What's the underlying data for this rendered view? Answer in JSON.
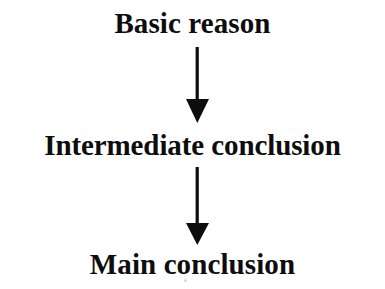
{
  "diagram": {
    "type": "flowchart",
    "orientation": "vertical-top-down",
    "background_color": "#ffffff",
    "ink_color": "#0d0d0d",
    "title": "",
    "nodes": [
      {
        "id": "basic-reason",
        "label": "Basic reason",
        "order": 1,
        "role": "premise"
      },
      {
        "id": "intermediate-conclusion",
        "label": "Intermediate conclusion",
        "order": 2,
        "role": "intermediate"
      },
      {
        "id": "main-conclusion",
        "label": "Main conclusion",
        "order": 3,
        "role": "conclusion"
      }
    ],
    "edges": [
      {
        "id": "arrow-basic-to-intermediate",
        "from": "basic-reason",
        "to": "intermediate-conclusion",
        "label": "",
        "direction": "down",
        "style": "solid-filled-arrowhead"
      },
      {
        "id": "arrow-intermediate-to-main",
        "from": "intermediate-conclusion",
        "to": "main-conclusion",
        "label": "",
        "direction": "down",
        "style": "solid-filled-arrowhead"
      }
    ],
    "artifacts": [
      {
        "id": "scan-speck",
        "description": "faint scan speck"
      }
    ]
  }
}
